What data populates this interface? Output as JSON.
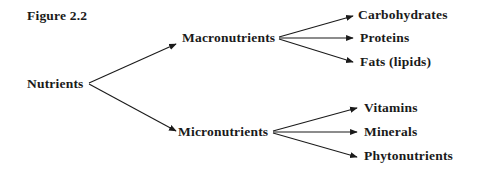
{
  "figure": {
    "title": "Figure 2.2",
    "root": {
      "label": "Nutrients"
    },
    "branches": [
      {
        "label": "Macronutrients",
        "children": [
          "Carbohydrates",
          "Proteins",
          "Fats (lipids)"
        ]
      },
      {
        "label": "Micronutrients",
        "children": [
          "Vitamins",
          "Minerals",
          "Phytonutrients"
        ]
      }
    ],
    "colors": {
      "text": "#1a1a1a",
      "arrow": "#1a1a1a",
      "background": "#ffffff"
    }
  }
}
